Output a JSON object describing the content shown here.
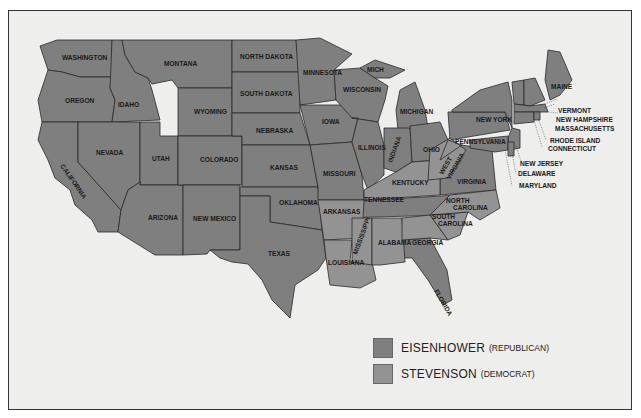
{
  "map": {
    "colors": {
      "eisenhower": "#7f7f7f",
      "stevenson": "#939393",
      "water": "#eeeeec",
      "border": "#2a2a2a"
    },
    "states": [
      {
        "name": "WASHINGTON",
        "winner": "eisenhower"
      },
      {
        "name": "OREGON",
        "winner": "eisenhower"
      },
      {
        "name": "CALIFORNIA",
        "winner": "eisenhower"
      },
      {
        "name": "IDAHO",
        "winner": "eisenhower"
      },
      {
        "name": "NEVADA",
        "winner": "eisenhower"
      },
      {
        "name": "MONTANA",
        "winner": "eisenhower"
      },
      {
        "name": "WYOMING",
        "winner": "eisenhower"
      },
      {
        "name": "UTAH",
        "winner": "eisenhower"
      },
      {
        "name": "ARIZONA",
        "winner": "eisenhower"
      },
      {
        "name": "COLORADO",
        "winner": "eisenhower"
      },
      {
        "name": "NEW MEXICO",
        "winner": "eisenhower"
      },
      {
        "name": "NORTH DAKOTA",
        "winner": "eisenhower"
      },
      {
        "name": "SOUTH DAKOTA",
        "winner": "eisenhower"
      },
      {
        "name": "NEBRASKA",
        "winner": "eisenhower"
      },
      {
        "name": "KANSAS",
        "winner": "eisenhower"
      },
      {
        "name": "OKLAHOMA",
        "winner": "eisenhower"
      },
      {
        "name": "TEXAS",
        "winner": "eisenhower"
      },
      {
        "name": "MINNESOTA",
        "winner": "eisenhower"
      },
      {
        "name": "IOWA",
        "winner": "eisenhower"
      },
      {
        "name": "MISSOURI",
        "winner": "eisenhower"
      },
      {
        "name": "ARKANSAS",
        "winner": "stevenson"
      },
      {
        "name": "LOUISIANA",
        "winner": "stevenson"
      },
      {
        "name": "WISCONSIN",
        "winner": "eisenhower"
      },
      {
        "name": "MICH",
        "winner": "eisenhower"
      },
      {
        "name": "MICHIGAN",
        "winner": "eisenhower"
      },
      {
        "name": "ILLINOIS",
        "winner": "eisenhower"
      },
      {
        "name": "INDIANA",
        "winner": "eisenhower"
      },
      {
        "name": "OHIO",
        "winner": "eisenhower"
      },
      {
        "name": "KENTUCKY",
        "winner": "stevenson"
      },
      {
        "name": "TENNESSEE",
        "winner": "eisenhower"
      },
      {
        "name": "MISSISSIPPI",
        "winner": "stevenson"
      },
      {
        "name": "ALABAMA",
        "winner": "stevenson"
      },
      {
        "name": "GEORGIA",
        "winner": "stevenson"
      },
      {
        "name": "FLORIDA",
        "winner": "eisenhower"
      },
      {
        "name": "SOUTH CAROLINA",
        "winner": "stevenson"
      },
      {
        "name": "NORTH CAROLINA",
        "winner": "stevenson"
      },
      {
        "name": "VIRGINIA",
        "winner": "eisenhower"
      },
      {
        "name": "WEST VIRGINIA",
        "winner": "stevenson"
      },
      {
        "name": "PENNSYLVANIA",
        "winner": "eisenhower"
      },
      {
        "name": "NEW YORK",
        "winner": "eisenhower"
      },
      {
        "name": "MAINE",
        "winner": "eisenhower"
      },
      {
        "name": "VERMONT",
        "winner": "eisenhower"
      },
      {
        "name": "NEW HAMPSHIRE",
        "winner": "eisenhower"
      },
      {
        "name": "MASSACHUSETTS",
        "winner": "eisenhower"
      },
      {
        "name": "RHODE ISLAND",
        "winner": "eisenhower"
      },
      {
        "name": "CONNECTICUT",
        "winner": "eisenhower"
      },
      {
        "name": "NEW JERSEY",
        "winner": "eisenhower"
      },
      {
        "name": "DELAWARE",
        "winner": "eisenhower"
      },
      {
        "name": "MARYLAND",
        "winner": "eisenhower"
      }
    ],
    "labels": {
      "wa": "WASHINGTON",
      "or": "OREGON",
      "ca": "CALIFORNIA",
      "id": "IDAHO",
      "nv": "NEVADA",
      "mt": "MONTANA",
      "wy": "WYOMING",
      "ut": "UTAH",
      "az": "ARIZONA",
      "co": "COLORADO",
      "nm": "NEW MEXICO",
      "nd": "NORTH DAKOTA",
      "sd": "SOUTH DAKOTA",
      "ne": "NEBRASKA",
      "ks": "KANSAS",
      "ok": "OKLAHOMA",
      "tx": "TEXAS",
      "mn": "MINNESOTA",
      "ia": "IOWA",
      "mo": "MISSOURI",
      "ar": "ARKANSAS",
      "la": "LOUISIANA",
      "wi": "WISCONSIN",
      "mi_up": "MICH",
      "mi": "MICHIGAN",
      "il": "ILLINOIS",
      "in": "INDIANA",
      "oh": "OHIO",
      "ky": "KENTUCKY",
      "tn": "TENNESSEE",
      "ms": "MISSISSIPPI",
      "al": "ALABAMA",
      "ga": "GEORGIA",
      "fl": "FLORIDA",
      "sc1": "SOUTH",
      "sc2": "CAROLINA",
      "nc1": "NORTH",
      "nc2": "CAROLINA",
      "va": "VIRGINIA",
      "wv1": "WEST",
      "wv2": "VIRGINIA",
      "pa": "PENNSYLVANIA",
      "ny": "NEW YORK",
      "me": "MAINE",
      "vt": "VERMONT",
      "nh": "NEW HAMPSHIRE",
      "ma": "MASSACHUSETTS",
      "ri": "RHODE ISLAND",
      "ct": "CONNECTICUT",
      "nj": "NEW JERSEY",
      "de": "DELAWARE",
      "md": "MARYLAND"
    }
  },
  "legend": {
    "items": [
      {
        "name": "EISENHOWER",
        "party": "(REPUBLICAN)",
        "color": "#7f7f7f"
      },
      {
        "name": "STEVENSON",
        "party": "(DEMOCRAT)",
        "color": "#939393"
      }
    ]
  }
}
